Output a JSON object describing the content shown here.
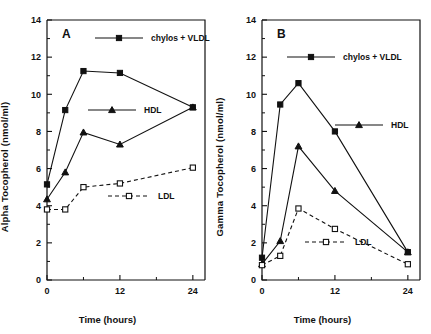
{
  "figure": {
    "panels": [
      {
        "tag": "A",
        "xlabel": "Time (hours)",
        "ylabel": "Alpha Tocopherol  (nmol/ml)"
      },
      {
        "tag": "B",
        "xlabel": "Time (hours)",
        "ylabel": "Gamma Tocopherol  (nmol/ml)"
      }
    ]
  },
  "axis": {
    "x_ticks": [
      "0",
      "12",
      "24"
    ],
    "y_ticks": [
      "0",
      "2",
      "4",
      "6",
      "8",
      "10",
      "12",
      "14"
    ]
  },
  "legend": {
    "chylos": "chylos + VLDL",
    "hdl": "HDL",
    "ldl": "LDL"
  },
  "chart_data": [
    {
      "type": "line",
      "title": "A",
      "xlabel": "Time (hours)",
      "ylabel": "Alpha Tocopherol  (nmol/ml)",
      "xlim": [
        0,
        26
      ],
      "ylim": [
        0,
        14
      ],
      "x_ticks": [
        0,
        12,
        24
      ],
      "y_ticks": [
        0,
        2,
        4,
        6,
        8,
        10,
        12,
        14
      ],
      "grid": false,
      "legend_position": "inside",
      "series": [
        {
          "name": "chylos + VLDL",
          "marker": "filled-square",
          "line": "solid",
          "x": [
            0,
            3,
            6,
            12,
            24
          ],
          "values": [
            5.15,
            9.15,
            11.25,
            11.15,
            9.3
          ]
        },
        {
          "name": "HDL",
          "marker": "filled-triangle",
          "line": "solid",
          "x": [
            0,
            3,
            6,
            12,
            24
          ],
          "values": [
            4.35,
            5.8,
            7.95,
            7.3,
            9.3
          ]
        },
        {
          "name": "LDL",
          "marker": "open-square",
          "line": "dashed",
          "x": [
            0,
            3,
            6,
            12,
            24
          ],
          "values": [
            3.8,
            3.8,
            5.0,
            5.2,
            6.05
          ]
        }
      ]
    },
    {
      "type": "line",
      "title": "B",
      "xlabel": "Time (hours)",
      "ylabel": "Gamma Tocopherol  (nmol/ml)",
      "xlim": [
        0,
        26
      ],
      "ylim": [
        0,
        14
      ],
      "x_ticks": [
        0,
        12,
        24
      ],
      "y_ticks": [
        0,
        2,
        4,
        6,
        8,
        10,
        12,
        14
      ],
      "grid": false,
      "legend_position": "inside",
      "series": [
        {
          "name": "chylos + VLDL",
          "marker": "filled-square",
          "line": "solid",
          "x": [
            0,
            3,
            6,
            12,
            24
          ],
          "values": [
            1.2,
            9.45,
            10.6,
            8.0,
            1.5
          ]
        },
        {
          "name": "HDL",
          "marker": "filled-triangle",
          "line": "solid",
          "x": [
            0,
            3,
            6,
            12,
            24
          ],
          "values": [
            0.85,
            2.1,
            7.2,
            4.8,
            1.5
          ]
        },
        {
          "name": "LDL",
          "marker": "open-square",
          "line": "dashed",
          "x": [
            0,
            3,
            6,
            12,
            24
          ],
          "values": [
            0.8,
            1.3,
            3.85,
            2.75,
            0.85
          ]
        }
      ]
    }
  ]
}
